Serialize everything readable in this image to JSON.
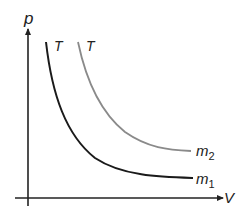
{
  "diagram": {
    "axes": {
      "y_label": "p",
      "x_label": "V"
    },
    "curves": [
      {
        "id": "m1",
        "temperature_label": "T",
        "label_base": "m",
        "label_sub": "1",
        "color": "#1a1a1a"
      },
      {
        "id": "m2",
        "temperature_label": "T",
        "label_base": "m",
        "label_sub": "2",
        "color": "#8a8a8a"
      }
    ],
    "colors": {
      "axis": "#222222",
      "background": "#ffffff"
    }
  }
}
